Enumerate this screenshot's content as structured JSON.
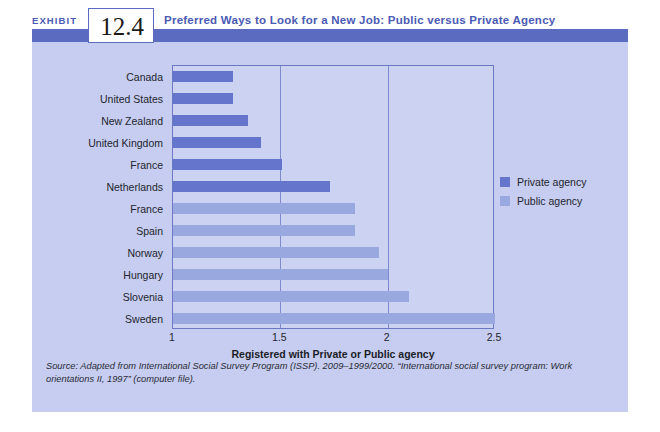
{
  "header": {
    "exhibit_word": "EXHIBIT",
    "exhibit_number": "12.4",
    "title": "Preferred Ways to Look for a New Job: Public versus Private Agency"
  },
  "legend": {
    "position": "right",
    "items": [
      {
        "label": "Private agency",
        "color": "#6575cc"
      },
      {
        "label": "Public agency",
        "color": "#9aa8e0"
      }
    ]
  },
  "source_note": "Source: Adapted from International Social Survey Program (ISSP). 2009–1999/2000. “International social survey program: Work orientations II, 1997” (computer file).",
  "colors": {
    "private_agency": "#6575cc",
    "public_agency": "#9aa8e0",
    "panel_background": "#c6cdf0",
    "plot_background": "#ccd3f2",
    "header_band": "#5b6bbf",
    "title_text": "#4a5ab5",
    "plot_border": "#6b79c4"
  },
  "chart_data": {
    "type": "bar",
    "orientation": "horizontal",
    "title": "Preferred Ways to Look for a New Job: Public versus Private Agency",
    "xlabel": "Registered with Private or Public agency",
    "ylabel": "",
    "xlim": [
      1,
      2.5
    ],
    "xticks": [
      "1",
      "1.5",
      "2",
      "2.5"
    ],
    "xtick_values": [
      1,
      1.5,
      2,
      2.5
    ],
    "grid": true,
    "grid_axis": "x",
    "legend_entries": [
      "Private agency",
      "Public agency"
    ],
    "categories": [
      "Canada",
      "United States",
      "New Zealand",
      "United Kingdom",
      "France",
      "Netherlands",
      "France",
      "Spain",
      "Norway",
      "Hungary",
      "Slovenia",
      "Sweden"
    ],
    "values": [
      1.28,
      1.28,
      1.35,
      1.41,
      1.51,
      1.73,
      1.85,
      1.85,
      1.96,
      2.0,
      2.1,
      2.5
    ],
    "groups": [
      "Private agency",
      "Private agency",
      "Private agency",
      "Private agency",
      "Private agency",
      "Private agency",
      "Public agency",
      "Public agency",
      "Public agency",
      "Public agency",
      "Public agency",
      "Public agency"
    ],
    "bars": [
      {
        "category": "Canada",
        "value": 1.28,
        "group": "Private agency"
      },
      {
        "category": "United States",
        "value": 1.28,
        "group": "Private agency"
      },
      {
        "category": "New Zealand",
        "value": 1.35,
        "group": "Private agency"
      },
      {
        "category": "United Kingdom",
        "value": 1.41,
        "group": "Private agency"
      },
      {
        "category": "France",
        "value": 1.51,
        "group": "Private agency"
      },
      {
        "category": "Netherlands",
        "value": 1.73,
        "group": "Private agency"
      },
      {
        "category": "France",
        "value": 1.85,
        "group": "Public agency"
      },
      {
        "category": "Spain",
        "value": 1.85,
        "group": "Public agency"
      },
      {
        "category": "Norway",
        "value": 1.96,
        "group": "Public agency"
      },
      {
        "category": "Hungary",
        "value": 2.0,
        "group": "Public agency"
      },
      {
        "category": "Slovenia",
        "value": 2.1,
        "group": "Public agency"
      },
      {
        "category": "Sweden",
        "value": 2.5,
        "group": "Public agency"
      }
    ]
  }
}
